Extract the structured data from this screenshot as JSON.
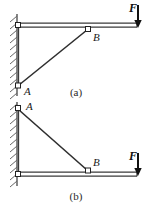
{
  "figure": {
    "background_color": "#ffffff",
    "line_color": "#333333",
    "ink_color": "#1a1a1a",
    "hatch_color": "#555555",
    "panels": [
      {
        "id": "panel-a",
        "caption": "(a)",
        "caption_x": 76,
        "caption_y": 96,
        "wall": {
          "x": 17,
          "y_top": 14,
          "y_bottom": 96,
          "hatch_count": 12,
          "hatch_length": 7
        },
        "beam": {
          "x_start": 17,
          "x_end": 137,
          "y": 25,
          "thickness": 4
        },
        "vertical_member": {
          "x": 18,
          "y_top": 25,
          "y_bottom": 86
        },
        "strut": {
          "x_start": 18,
          "y_start": 86,
          "x_end": 88,
          "y_end": 30
        },
        "joints": [
          {
            "name": "A",
            "x": 18,
            "y": 86,
            "label_x": 24,
            "label_y": 94
          },
          {
            "name": "B",
            "x": 88,
            "y": 30,
            "label_x": 93,
            "label_y": 41
          }
        ],
        "force": {
          "label": "F",
          "label_x": 132,
          "label_y": 12,
          "arrow_x": 138,
          "arrow_y_start": 5,
          "arrow_y_end": 27
        }
      },
      {
        "id": "panel-b",
        "caption": "(b)",
        "caption_x": 76,
        "caption_y": 199,
        "wall": {
          "x": 17,
          "y_top": 104,
          "y_bottom": 186,
          "hatch_count": 12,
          "hatch_length": 7
        },
        "beam": {
          "x_start": 17,
          "x_end": 137,
          "y": 174,
          "thickness": 4
        },
        "vertical_member": {
          "x": 18,
          "y_top": 108,
          "y_bottom": 174
        },
        "strut": {
          "x_start": 18,
          "y_start": 108,
          "x_end": 88,
          "y_end": 170
        },
        "joints": [
          {
            "name": "A",
            "x": 18,
            "y": 108,
            "label_x": 26,
            "label_y": 110
          },
          {
            "name": "B",
            "x": 88,
            "y": 170,
            "label_x": 93,
            "label_y": 165
          }
        ],
        "force": {
          "label": "F",
          "label_x": 132,
          "label_y": 160,
          "arrow_x": 138,
          "arrow_y_start": 153,
          "arrow_y_end": 176
        }
      }
    ]
  }
}
